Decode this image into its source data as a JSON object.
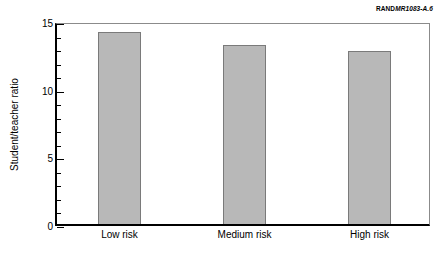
{
  "source_tag": {
    "brand": "RAND",
    "code": "MR1083-A.6"
  },
  "chart_data": {
    "type": "bar",
    "title": "",
    "xlabel": "",
    "ylabel": "Student/teacher ratio",
    "categories": [
      "Low risk",
      "Medium risk",
      "High risk"
    ],
    "values": [
      14.2,
      13.2,
      12.8
    ],
    "ylim": [
      0,
      15
    ],
    "ytick_labels": [
      "0",
      "5",
      "10",
      "15"
    ],
    "ytick_values": [
      0,
      5,
      10,
      15
    ],
    "minor_tick_step": 1,
    "grid": false,
    "legend": "none",
    "bar_color": "#b8b8b8",
    "bar_edge_color": "#7a7a7a",
    "axis_color": "#000000"
  }
}
